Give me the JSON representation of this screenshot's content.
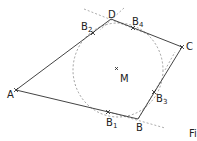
{
  "diagram": {
    "type": "tangential quadrilateral with incircle",
    "vertices": [
      {
        "label": "A",
        "x": 16,
        "y": 90
      },
      {
        "label": "B",
        "x": 138,
        "y": 119
      },
      {
        "label": "C",
        "x": 182,
        "y": 47
      },
      {
        "label": "D",
        "x": 111,
        "y": 19
      }
    ],
    "center": {
      "label": "M",
      "x": 117,
      "y": 69
    },
    "tangent_points": [
      {
        "label": "B",
        "sub": "1",
        "x": 108,
        "y": 112
      },
      {
        "label": "B",
        "sub": "2",
        "x": 93,
        "y": 33
      },
      {
        "label": "B",
        "sub": "3",
        "x": 154,
        "y": 92
      },
      {
        "label": "B",
        "sub": "4",
        "x": 133,
        "y": 28
      }
    ],
    "circle": {
      "cx": 118,
      "cy": 70,
      "rx": 45,
      "ry": 47,
      "style": "dashed"
    },
    "caption_fragment": "Fi",
    "colors": {
      "lines": "#444444",
      "dashed": "#777777",
      "text": "#222222"
    }
  }
}
